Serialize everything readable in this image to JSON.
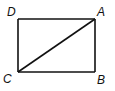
{
  "figure": {
    "type": "rectangle-with-diagonal",
    "vertices": {
      "top_left": "D",
      "top_right": "A",
      "bottom_left": "C",
      "bottom_right": "B"
    },
    "edges": [
      "DA",
      "AB",
      "BC",
      "CD"
    ],
    "diagonals": [
      "CA"
    ],
    "stroke_color": "#111111"
  }
}
